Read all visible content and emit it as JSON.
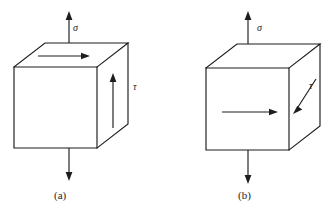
{
  "figure": {
    "type": "engineering-stress-diagram",
    "background_color": "#ffffff",
    "line_color": "#1d1d1d",
    "width": 335,
    "height": 218
  },
  "panels": [
    {
      "id": "a",
      "caption": "(a)",
      "sigma_label": "σ",
      "tau_label": "τ",
      "shear_arrow_faces": [
        "top",
        "right"
      ],
      "shear_top_direction": "right",
      "shear_right_direction": "up",
      "sigma_arrow_top_direction": "up",
      "sigma_arrow_bottom_direction": "down",
      "cube": {
        "front_left_x": 14,
        "front_right_x": 97,
        "front_top_y": 67,
        "front_bottom_y": 148,
        "depth_dx": 31,
        "depth_dy": -24
      }
    },
    {
      "id": "b",
      "caption": "(b)",
      "sigma_label": "σ",
      "tau_label": "τ",
      "shear_arrow_faces": [
        "front",
        "right"
      ],
      "shear_front_direction": "right",
      "shear_right_direction": "down-left",
      "sigma_arrow_top_direction": "up",
      "sigma_arrow_bottom_direction": "down",
      "cube": {
        "front_left_x": 206,
        "front_right_x": 289,
        "front_top_y": 68,
        "front_bottom_y": 150,
        "depth_dx": 31,
        "depth_dy": -24
      }
    }
  ],
  "labels": {
    "sigma_a": "σ",
    "tau_a": "τ",
    "caption_a": "(a)",
    "sigma_b": "σ",
    "tau_b": "τ",
    "caption_b": "(b)"
  }
}
